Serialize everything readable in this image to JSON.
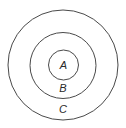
{
  "diagram": {
    "type": "nested-sets",
    "sets": [
      {
        "id": "outer",
        "label": "C",
        "contains": "B"
      },
      {
        "id": "middle",
        "label": "B",
        "contains": "A"
      },
      {
        "id": "inner",
        "label": "A",
        "contains": null
      }
    ],
    "colors": {
      "stroke": "#4a4a4a",
      "text": "#2a2a2a",
      "background": "#ffffff"
    }
  }
}
